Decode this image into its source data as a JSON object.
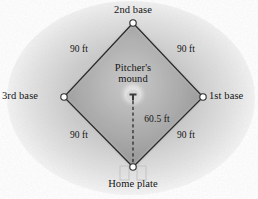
{
  "figure": {
    "background_color": "#ffffff",
    "field_fill_color": "#9a9a9a",
    "line_color": "#2b2b2b",
    "base_marker_color": "#ffffff",
    "mound_color": "#d8d8d8"
  },
  "bases": {
    "second": "2nd base",
    "third": "3rd base",
    "first": "1st base",
    "home": "Home plate"
  },
  "mound": {
    "line1": "Pitcher's",
    "line2": "mound"
  },
  "distances": {
    "top_left": "90 ft",
    "top_right": "90 ft",
    "bottom_left": "90 ft",
    "bottom_right": "90 ft",
    "mound_to_home": "60.5 ft"
  },
  "geometry": {
    "second_base": [
      133,
      23
    ],
    "third_base": [
      64,
      97
    ],
    "first_base": [
      203,
      97
    ],
    "home_plate": [
      133,
      167
    ],
    "mound_center": [
      133,
      97
    ]
  }
}
